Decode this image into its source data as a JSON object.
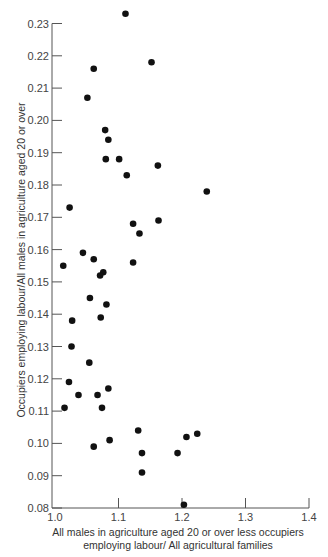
{
  "chart_data": {
    "type": "scatter",
    "title": "",
    "xlabel_lines": [
      "All males in agriculture aged 20 or over  less occupiers",
      "employing labour/ All agricultural families"
    ],
    "xlabel": "All males in agriculture aged 20 or over less occupiers employing labour/ All agricultural families",
    "ylabel": "Occupiers employing labour/All males in agriculture aged 20 or over",
    "xlim": [
      1.0,
      1.4
    ],
    "ylim": [
      0.08,
      0.23
    ],
    "x_ticks": [
      1.0,
      1.1,
      1.2,
      1.3,
      1.4
    ],
    "x_tick_labels": [
      "1.0",
      "1.1",
      "1.2",
      "1.3",
      "1.4"
    ],
    "y_ticks": [
      0.08,
      0.09,
      0.1,
      0.11,
      0.12,
      0.13,
      0.14,
      0.15,
      0.16,
      0.17,
      0.18,
      0.19,
      0.2,
      0.21,
      0.22,
      0.23
    ],
    "y_tick_labels": [
      "0.08",
      "0.09",
      "0.10",
      "0.11",
      "0.12",
      "0.13",
      "0.14",
      "0.15",
      "0.16",
      "0.17",
      "0.18",
      "0.19",
      "0.20",
      "0.21",
      "0.22",
      "0.23"
    ],
    "grid": false,
    "legend": null,
    "points": [
      [
        1.111,
        0.233
      ],
      [
        1.152,
        0.218
      ],
      [
        1.061,
        0.216
      ],
      [
        1.051,
        0.207
      ],
      [
        1.079,
        0.197
      ],
      [
        1.084,
        0.194
      ],
      [
        1.08,
        0.188
      ],
      [
        1.101,
        0.188
      ],
      [
        1.162,
        0.186
      ],
      [
        1.113,
        0.183
      ],
      [
        1.239,
        0.178
      ],
      [
        1.023,
        0.173
      ],
      [
        1.163,
        0.169
      ],
      [
        1.123,
        0.168
      ],
      [
        1.133,
        0.165
      ],
      [
        1.044,
        0.159
      ],
      [
        1.061,
        0.157
      ],
      [
        1.123,
        0.156
      ],
      [
        1.013,
        0.155
      ],
      [
        1.076,
        0.153
      ],
      [
        1.071,
        0.152
      ],
      [
        1.055,
        0.145
      ],
      [
        1.081,
        0.143
      ],
      [
        1.072,
        0.139
      ],
      [
        1.027,
        0.138
      ],
      [
        1.026,
        0.13
      ],
      [
        1.054,
        0.125
      ],
      [
        1.022,
        0.119
      ],
      [
        1.084,
        0.117
      ],
      [
        1.037,
        0.115
      ],
      [
        1.067,
        0.115
      ],
      [
        1.015,
        0.111
      ],
      [
        1.074,
        0.111
      ],
      [
        1.131,
        0.104
      ],
      [
        1.224,
        0.103
      ],
      [
        1.207,
        0.102
      ],
      [
        1.086,
        0.101
      ],
      [
        1.061,
        0.099
      ],
      [
        1.137,
        0.097
      ],
      [
        1.193,
        0.097
      ],
      [
        1.137,
        0.091
      ],
      [
        1.203,
        0.081
      ]
    ]
  }
}
